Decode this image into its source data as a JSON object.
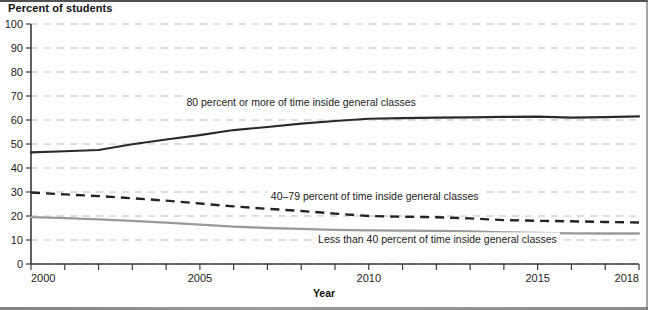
{
  "page": {
    "y_axis_title": "Percent of students",
    "x_axis_title": "Year"
  },
  "chart_data": {
    "type": "line",
    "title": "",
    "subtitle": "",
    "xlabel": "Year",
    "ylabel": "Percent of students",
    "xlim": [
      2000,
      2018
    ],
    "ylim": [
      0,
      100
    ],
    "grid": "horizontal-dashed",
    "legend_position": "inline-annotations",
    "y_ticks": [
      0,
      10,
      20,
      30,
      40,
      50,
      60,
      70,
      80,
      90,
      100
    ],
    "y_tick_labels": [
      "0",
      "10",
      "20",
      "30",
      "40",
      "50",
      "60",
      "70",
      "80",
      "90",
      "100"
    ],
    "x_ticks": [
      2000,
      2001,
      2002,
      2003,
      2004,
      2005,
      2006,
      2007,
      2008,
      2009,
      2010,
      2011,
      2012,
      2013,
      2014,
      2015,
      2016,
      2017,
      2018
    ],
    "x_tick_labels_shown": [
      "2000",
      "2005",
      "2010",
      "2015",
      "2018"
    ],
    "x": [
      2000,
      2001,
      2002,
      2003,
      2004,
      2005,
      2006,
      2007,
      2008,
      2009,
      2010,
      2011,
      2012,
      2013,
      2014,
      2015,
      2016,
      2017,
      2018
    ],
    "series": [
      {
        "name": "80 percent or more of time inside general classes",
        "style": "solid",
        "color": "#2a2a2a",
        "label_text": "80 percent or more of time inside general classes",
        "values": [
          46.5,
          47.0,
          47.5,
          49.9,
          51.9,
          53.7,
          55.8,
          57.1,
          58.5,
          59.6,
          60.5,
          60.8,
          61.0,
          61.1,
          61.3,
          61.4,
          61.0,
          61.2,
          61.5
        ]
      },
      {
        "name": "40-79 percent of time inside general classes",
        "style": "dashed",
        "color": "#232323",
        "label_text": "40–79 percent of time inside general classes",
        "values": [
          29.8,
          29.0,
          28.3,
          27.4,
          26.4,
          25.2,
          24.0,
          23.0,
          22.1,
          21.0,
          20.0,
          19.7,
          19.5,
          19.0,
          18.3,
          18.0,
          17.8,
          17.5,
          17.3
        ]
      },
      {
        "name": "Less than 40 percent of time inside general classes",
        "style": "solid",
        "color": "#9a9a9a",
        "label_text": "Less than 40 percent of time inside general classes",
        "values": [
          19.5,
          19.1,
          18.6,
          18.0,
          17.2,
          16.4,
          15.6,
          15.0,
          14.6,
          14.2,
          14.0,
          13.9,
          13.8,
          13.6,
          13.2,
          13.0,
          12.8,
          12.7,
          12.7
        ]
      }
    ],
    "annotations": [
      {
        "text": "80 percent or more of time inside general classes",
        "x": 2004.6,
        "y": 66.0
      },
      {
        "text": "40–79 percent of time inside general classes",
        "x": 2007.1,
        "y": 26.5
      },
      {
        "text": "Less than 40 percent of time inside general classes",
        "x": 2008.5,
        "y": 8.6
      }
    ]
  }
}
